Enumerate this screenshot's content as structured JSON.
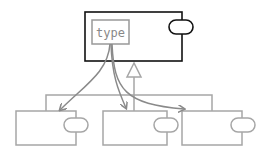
{
  "diagram": {
    "type_box_label": "type",
    "colors": {
      "parent_stroke": "#111111",
      "child_stroke": "#a6a6a6",
      "arrow_stroke": "#8a8a8a",
      "type_box_stroke": "#999999"
    },
    "nodes": [
      {
        "id": "parent-component",
        "kind": "component",
        "has_port": true
      },
      {
        "id": "type-box",
        "kind": "type",
        "label": "type"
      },
      {
        "id": "child-component-1",
        "kind": "component",
        "has_port": true
      },
      {
        "id": "child-component-2",
        "kind": "component",
        "has_port": true
      },
      {
        "id": "child-component-3",
        "kind": "component",
        "has_port": true
      }
    ],
    "edges": [
      {
        "from": "type-box",
        "to": "child-component-1",
        "kind": "dependency-arrow"
      },
      {
        "from": "type-box",
        "to": "child-component-2",
        "kind": "dependency-arrow"
      },
      {
        "from": "type-box",
        "to": "child-component-3",
        "kind": "dependency-arrow"
      },
      {
        "from": "children",
        "to": "parent-component",
        "kind": "generalization"
      }
    ]
  }
}
